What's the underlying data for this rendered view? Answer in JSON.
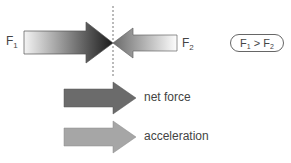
{
  "forces": {
    "f1": {
      "symbol": "F",
      "subscript": "1"
    },
    "f2": {
      "symbol": "F",
      "subscript": "2"
    }
  },
  "relation": {
    "left": "F",
    "left_sub": "1",
    "op": ">",
    "right": "F",
    "right_sub": "2"
  },
  "legend": {
    "net_force": {
      "label": "net force",
      "color": "#6b6b6b"
    },
    "acceleration": {
      "label": "acceleration",
      "color": "#a6a6a6"
    }
  },
  "colors": {
    "f1_start": "#f2f2f2",
    "f1_end": "#1e1e1e",
    "f2_start": "#fafafa",
    "f2_end": "#6e6e6e",
    "dashed_line": "#777777"
  }
}
